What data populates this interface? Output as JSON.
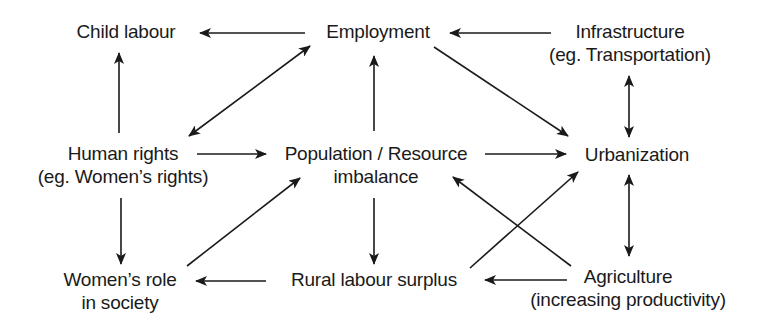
{
  "diagram": {
    "title": "",
    "colors": {
      "stroke": "#1a1a1a",
      "text": "#1a1a1a",
      "background": "#ffffff"
    },
    "nodes": {
      "child_labour": {
        "lines": [
          "Child labour"
        ]
      },
      "employment": {
        "lines": [
          "Employment"
        ]
      },
      "infrastructure": {
        "lines": [
          "Infrastructure",
          "(eg. Transportation)"
        ]
      },
      "human_rights": {
        "lines": [
          "Human rights",
          "(eg. Women’s rights)"
        ]
      },
      "population": {
        "lines": [
          "Population / Resource",
          "imbalance"
        ]
      },
      "urbanization": {
        "lines": [
          "Urbanization"
        ]
      },
      "womens_role": {
        "lines": [
          "Women’s role",
          "in society"
        ]
      },
      "rural_labour": {
        "lines": [
          "Rural labour surplus"
        ]
      },
      "agriculture": {
        "lines": [
          "Agriculture",
          "(increasing productivity)"
        ]
      }
    },
    "edges": [
      {
        "from": "Employment",
        "to": "Child labour",
        "direction": "single"
      },
      {
        "from": "Infrastructure",
        "to": "Employment",
        "direction": "single"
      },
      {
        "from": "Human rights",
        "to": "Child labour",
        "direction": "single"
      },
      {
        "from": "Human rights",
        "to": "Employment",
        "direction": "double"
      },
      {
        "from": "Population / Resource imbalance",
        "to": "Employment",
        "direction": "single"
      },
      {
        "from": "Employment",
        "to": "Urbanization",
        "direction": "single"
      },
      {
        "from": "Infrastructure",
        "to": "Urbanization",
        "direction": "double"
      },
      {
        "from": "Human rights",
        "to": "Population / Resource imbalance",
        "direction": "single"
      },
      {
        "from": "Population / Resource imbalance",
        "to": "Urbanization",
        "direction": "single"
      },
      {
        "from": "Human rights",
        "to": "Women’s role in society",
        "direction": "single"
      },
      {
        "from": "Women’s role in society",
        "to": "Population / Resource imbalance",
        "direction": "single"
      },
      {
        "from": "Population / Resource imbalance",
        "to": "Rural labour surplus",
        "direction": "single"
      },
      {
        "from": "Rural labour surplus",
        "to": "Women’s role in society",
        "direction": "single"
      },
      {
        "from": "Rural labour surplus",
        "to": "Urbanization",
        "direction": "single"
      },
      {
        "from": "Agriculture",
        "to": "Population / Resource imbalance",
        "direction": "single"
      },
      {
        "from": "Agriculture",
        "to": "Rural labour surplus",
        "direction": "single"
      },
      {
        "from": "Urbanization",
        "to": "Agriculture",
        "direction": "double"
      }
    ]
  }
}
